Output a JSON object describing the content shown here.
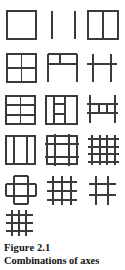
{
  "figure": {
    "caption_label": "Figure 2.1",
    "caption_title": "Combinations of axes",
    "stroke_color": "#3b3b3b",
    "background_color": "#ffffff",
    "text_color": "#121212",
    "columns": 3,
    "rows": 6,
    "total_diagrams": 16
  },
  "diagrams": [
    {
      "index": 1,
      "row": 1,
      "column": 1,
      "name": "closed-square",
      "description": "Closed square outline"
    },
    {
      "index": 2,
      "row": 1,
      "column": 2,
      "name": "two-parallel-vertical-lines",
      "description": "Two separated parallel vertical lines"
    },
    {
      "index": 3,
      "row": 1,
      "column": 3,
      "name": "square-with-one-vertical-divider",
      "description": "Square divided by a single vertical line"
    },
    {
      "index": 4,
      "row": 2,
      "column": 1,
      "name": "square-quartered",
      "description": "Square divided into four quadrants"
    },
    {
      "index": 5,
      "row": 2,
      "column": 2,
      "name": "open-bottom-square-with-top-cell",
      "description": "Two verticals with top horizontal and a second horizontal forming an upper cell, open at bottom"
    },
    {
      "index": 6,
      "row": 2,
      "column": 3,
      "name": "h-shape-two-verticals-one-crossbar",
      "description": "Two free verticals joined by one horizontal crossbar"
    },
    {
      "index": 7,
      "row": 3,
      "column": 1,
      "name": "square-six-cells",
      "description": "Square with one vertical and two horizontal dividers"
    },
    {
      "index": 8,
      "row": 3,
      "column": 2,
      "name": "square-with-inner-ladder",
      "description": "Square enclosing two short verticals joined by two horizontals"
    },
    {
      "index": 9,
      "row": 3,
      "column": 3,
      "name": "open-ladder-between-verticals",
      "description": "Two tall verticals with two horizontals and short inner verticals between them"
    },
    {
      "index": 10,
      "row": 4,
      "column": 1,
      "name": "square-three-columns",
      "description": "Square divided by two vertical lines into three columns"
    },
    {
      "index": 11,
      "row": 4,
      "column": 2,
      "name": "square-grid-with-overhangs",
      "description": "Square with two verticals and two horizontals whose ends overhang the outline"
    },
    {
      "index": 12,
      "row": 4,
      "column": 3,
      "name": "open-grid-four-corner-cells",
      "description": "Crossing lines with overhanging ends forming four corner squares"
    },
    {
      "index": 13,
      "row": 5,
      "column": 1,
      "name": "cross-of-overlapping-rectangles",
      "description": "Central square crossed by bands extending on all four sides"
    },
    {
      "index": 14,
      "row": 5,
      "column": 2,
      "name": "hash-three-by-three",
      "description": "Three verticals crossing three horizontals, all ends overhanging"
    },
    {
      "index": 15,
      "row": 5,
      "column": 3,
      "name": "hash-two-by-two",
      "description": "Two verticals crossing two horizontals, all ends overhanging"
    },
    {
      "index": 16,
      "row": 6,
      "column": 1,
      "name": "dense-hash-three-by-three",
      "description": "Tight three by three hash of crossing axes with overhanging ends"
    }
  ]
}
